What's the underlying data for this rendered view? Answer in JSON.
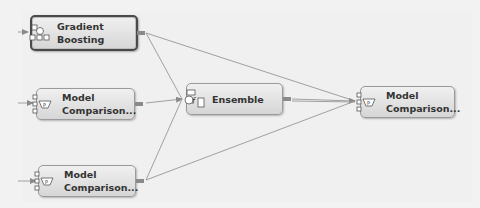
{
  "diagram": {
    "nodes": [
      {
        "id": "gradient-boosting",
        "label": "Gradient\nBoosting",
        "icon": "gradient-boosting-icon",
        "selected": true
      },
      {
        "id": "model-comparison-1",
        "label": "Model\nComparison...",
        "icon": "model-comparison-icon",
        "selected": false
      },
      {
        "id": "model-comparison-2",
        "label": "Model\nComparison...",
        "icon": "model-comparison-icon",
        "selected": false
      },
      {
        "id": "ensemble",
        "label": "Ensemble",
        "icon": "ensemble-icon",
        "selected": false
      },
      {
        "id": "model-comparison-3",
        "label": "Model\nComparison...",
        "icon": "model-comparison-icon",
        "selected": false
      }
    ],
    "edges": [
      {
        "from": "gradient-boosting",
        "to": "ensemble"
      },
      {
        "from": "gradient-boosting",
        "to": "model-comparison-3"
      },
      {
        "from": "model-comparison-1",
        "to": "ensemble"
      },
      {
        "from": "model-comparison-2",
        "to": "ensemble"
      },
      {
        "from": "model-comparison-2",
        "to": "model-comparison-3"
      },
      {
        "from": "ensemble",
        "to": "model-comparison-3"
      }
    ],
    "colors": {
      "edge": "#9a9a9a",
      "node_border": "#9a9a9a",
      "selected_border": "#4a4a4a",
      "background": "#f2f2f2"
    }
  }
}
